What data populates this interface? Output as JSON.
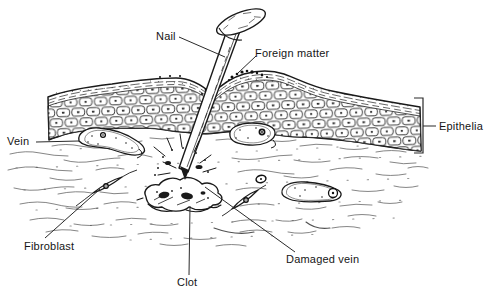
{
  "figure_labels": {
    "nail": "Nail",
    "foreign_matter": "Foreign matter",
    "epithelia": "Epithelia",
    "vein": "Vein",
    "fibroblast": "Fibroblast",
    "clot": "Clot",
    "damaged_vein": "Damaged vein"
  },
  "colors": {
    "background": "#ffffff",
    "ink": "#1a1a1a",
    "label_text": "#151515"
  }
}
